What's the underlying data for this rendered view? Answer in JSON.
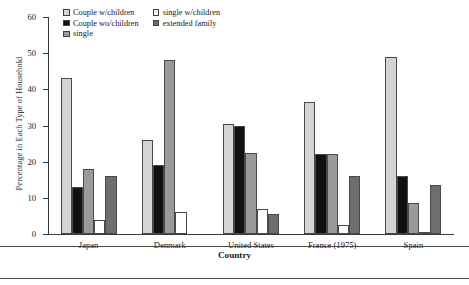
{
  "chart_data": {
    "type": "bar",
    "title": "",
    "xlabel": "Country",
    "ylabel": "Percentage in Each Type of Household",
    "ylim": [
      0,
      60
    ],
    "yticks": [
      0,
      10,
      20,
      30,
      40,
      50,
      60
    ],
    "grid": false,
    "legend_position": "top-left-inside",
    "categories": [
      "Japan",
      "Denmark",
      "United States",
      "France (1975)",
      "Spain"
    ],
    "series": [
      {
        "name": "Couple w/children",
        "color": "#d4d4d2",
        "values": [
          43,
          26,
          30.5,
          36.5,
          49
        ]
      },
      {
        "name": "Couple wo/children",
        "color": "#111111",
        "values": [
          13,
          19,
          30,
          22,
          16
        ]
      },
      {
        "name": "single",
        "color": "#9a9a98",
        "values": [
          18,
          48,
          22.5,
          22,
          8.5
        ]
      },
      {
        "name": "single w/children",
        "color": "#ffffff",
        "values": [
          4,
          6,
          7,
          2.5,
          0.5
        ]
      },
      {
        "name": "extended family",
        "color": "#6e6e6c",
        "values": [
          16,
          0,
          5.5,
          16,
          13.5
        ]
      }
    ]
  },
  "legend": {
    "items": [
      {
        "label": "Couple w/children",
        "swatch": "swatch-light-gray"
      },
      {
        "label": "single w/children",
        "swatch": "swatch-white"
      },
      {
        "label": "Couple wo/children",
        "swatch": "swatch-black"
      },
      {
        "label": "extended family",
        "swatch": "swatch-dark-gray"
      },
      {
        "label": "single",
        "swatch": "swatch-medium-gray"
      }
    ]
  },
  "axes": {
    "y": {
      "label": "Percentage in Each Type of Household",
      "tick_labels": [
        "60",
        "50",
        "40",
        "30",
        "20",
        "10",
        "0"
      ]
    },
    "x": {
      "label": "Country",
      "tick_labels": [
        "Japan",
        "Denmark",
        "United States",
        "France (1975)",
        "Spain"
      ]
    }
  }
}
